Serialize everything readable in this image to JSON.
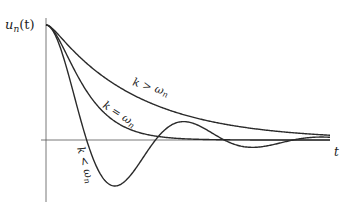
{
  "chart_data": {
    "type": "line",
    "title": "",
    "ylabel": "u_n(t)",
    "xlabel": "t",
    "y_axis_label_display": "u",
    "y_axis_label_sub": "n",
    "y_axis_label_suffix": "(t)",
    "x_axis_label_display": "t",
    "initial_value": 1.0,
    "omega_n": 1.0,
    "t_range": [
      0,
      13.5
    ],
    "y_range": [
      -0.45,
      1.05
    ],
    "series": [
      {
        "name": "overdamped",
        "label": "k > ω",
        "label_sub": "n",
        "k": 2.2
      },
      {
        "name": "critically-damped",
        "label": "k = ω",
        "label_sub": "n",
        "k": 1.0
      },
      {
        "name": "underdamped",
        "label": "k < ω",
        "label_sub": "n",
        "k": 0.28
      }
    ]
  }
}
